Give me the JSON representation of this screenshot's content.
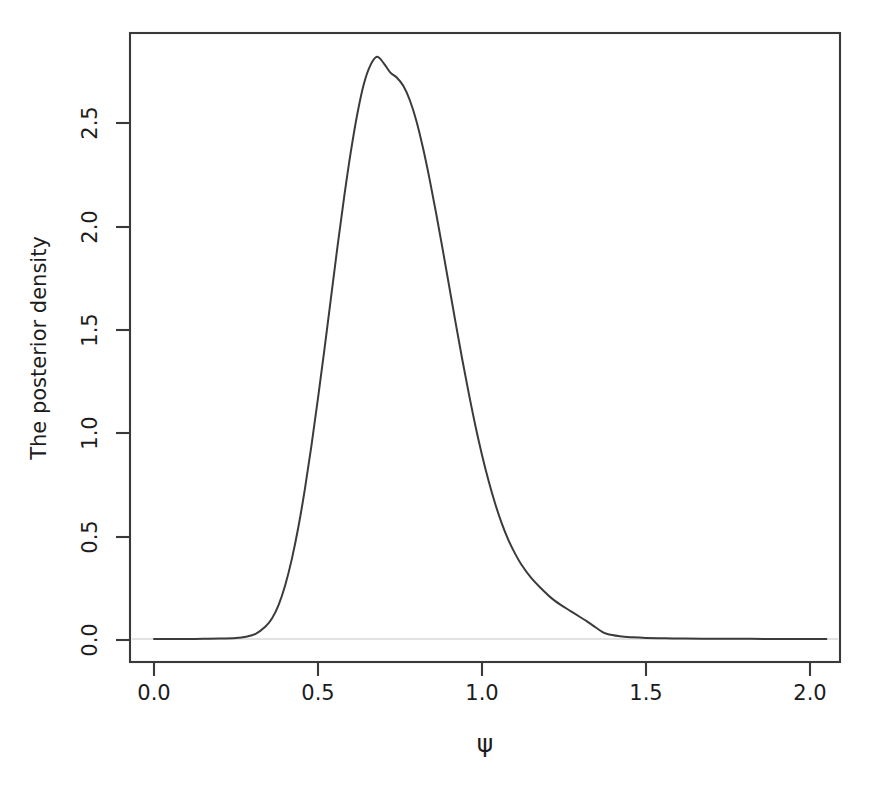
{
  "chart_data": {
    "type": "line",
    "title": "",
    "subtitle": "",
    "xlabel": "ψ",
    "ylabel": "The posterior density",
    "xlim": [
      -0.07,
      2.1
    ],
    "ylim": [
      -0.06,
      2.95
    ],
    "grid": false,
    "legend": null,
    "xticks": [
      0.0,
      0.5,
      1.0,
      1.5,
      2.0
    ],
    "xticklabels": [
      "0.0",
      "0.5",
      "1.0",
      "1.5",
      "2.0"
    ],
    "yticks": [
      0.0,
      0.5,
      1.0,
      1.5,
      2.0,
      2.5
    ],
    "yticklabels": [
      "0.0",
      "0.5",
      "1.0",
      "1.5",
      "2.0",
      "2.5"
    ],
    "series": [
      {
        "name": "posterior density of psi",
        "color": "#3b3b3b",
        "x": [
          0.0,
          0.05,
          0.1,
          0.15,
          0.2,
          0.25,
          0.28,
          0.31,
          0.34,
          0.36,
          0.38,
          0.4,
          0.42,
          0.44,
          0.46,
          0.48,
          0.5,
          0.52,
          0.54,
          0.56,
          0.58,
          0.6,
          0.62,
          0.64,
          0.66,
          0.68,
          0.7,
          0.72,
          0.74,
          0.76,
          0.78,
          0.8,
          0.82,
          0.84,
          0.86,
          0.88,
          0.9,
          0.92,
          0.94,
          0.96,
          0.98,
          1.0,
          1.02,
          1.04,
          1.06,
          1.08,
          1.1,
          1.12,
          1.15,
          1.18,
          1.21,
          1.24,
          1.27,
          1.3,
          1.32,
          1.34,
          1.36,
          1.38,
          1.42,
          1.46,
          1.5,
          1.56,
          1.62,
          1.7,
          1.78,
          1.86,
          1.94,
          2.0,
          2.05
        ],
        "y": [
          0.005,
          0.005,
          0.005,
          0.006,
          0.007,
          0.01,
          0.016,
          0.03,
          0.065,
          0.105,
          0.17,
          0.265,
          0.39,
          0.545,
          0.73,
          0.94,
          1.17,
          1.41,
          1.66,
          1.91,
          2.145,
          2.36,
          2.545,
          2.69,
          2.78,
          2.82,
          2.79,
          2.745,
          2.72,
          2.68,
          2.61,
          2.51,
          2.38,
          2.23,
          2.065,
          1.89,
          1.71,
          1.53,
          1.355,
          1.19,
          1.035,
          0.895,
          0.77,
          0.66,
          0.565,
          0.485,
          0.42,
          0.365,
          0.3,
          0.25,
          0.205,
          0.17,
          0.14,
          0.11,
          0.09,
          0.068,
          0.046,
          0.03,
          0.018,
          0.013,
          0.01,
          0.008,
          0.007,
          0.006,
          0.006,
          0.005,
          0.005,
          0.005,
          0.005
        ]
      }
    ],
    "annotations": []
  },
  "axes": {
    "x_title": "ψ",
    "y_title": "The posterior density"
  },
  "style": {
    "background": "#ffffff",
    "curve_color": "#3b3b3b",
    "frame_color": "#3a3a3a",
    "text_color": "#1c1c1c"
  }
}
